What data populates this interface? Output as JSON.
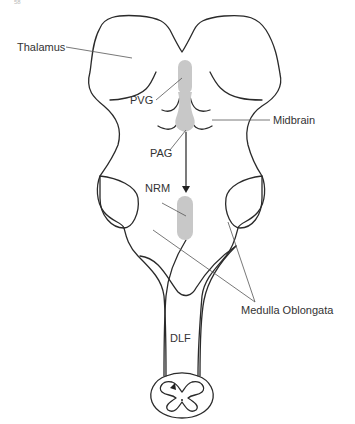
{
  "figure": {
    "page_fragment": "58",
    "labels": {
      "thalamus": "Thalamus",
      "pvg": "PVG",
      "midbrain": "Midbrain",
      "pag": "PAG",
      "nrm": "NRM",
      "medulla": "Medulla Oblongata",
      "dlf": "DLF"
    },
    "colors": {
      "outline": "#2a2a2a",
      "shaded_region": "#c8c8c8",
      "leader_lines": "#555555"
    }
  }
}
